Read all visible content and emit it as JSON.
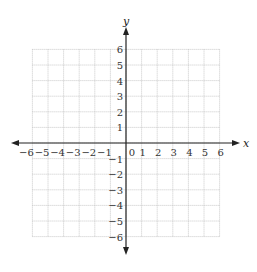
{
  "diagram": {
    "type": "coordinate-grid",
    "x_axis": {
      "label": "x",
      "min": -6,
      "max": 6,
      "ticks": [
        "−6",
        "−5",
        "−4",
        "−3",
        "−2",
        "−1",
        "0",
        "1",
        "2",
        "3",
        "4",
        "5",
        "6"
      ]
    },
    "y_axis": {
      "label": "y",
      "min": -6,
      "max": 6,
      "ticks_positive": [
        "1",
        "2",
        "3",
        "4",
        "5",
        "6"
      ],
      "ticks_negative": [
        "−1",
        "−2",
        "−3",
        "−4",
        "−5",
        "−6"
      ]
    },
    "grid": {
      "style": "dotted",
      "color": "#bbbbbb"
    },
    "axis_color": "#222222"
  }
}
